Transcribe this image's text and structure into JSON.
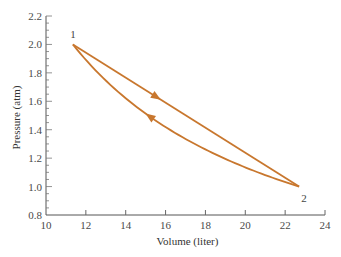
{
  "chart_data": {
    "type": "line",
    "title": "",
    "xlabel": "Volume (liter)",
    "ylabel": "Pressure (atm)",
    "xlim": [
      10,
      24
    ],
    "ylim": [
      0.8,
      2.2
    ],
    "x_ticks": [
      10,
      12,
      14,
      16,
      18,
      20,
      22,
      24
    ],
    "x_tick_labels": [
      "10",
      "12",
      "14",
      "16",
      "18",
      "20",
      "22",
      "24"
    ],
    "y_ticks": [
      0.8,
      1.0,
      1.2,
      1.4,
      1.6,
      1.8,
      2.0,
      2.2
    ],
    "y_tick_labels": [
      "0.8",
      "1.0",
      "1.2",
      "1.4",
      "1.6",
      "1.8",
      "2.0",
      "2.2"
    ],
    "y_minor_step": 0.05,
    "grid": false,
    "legend": null,
    "color": "#c8772e",
    "points": [
      {
        "label": "1",
        "x": 11.35,
        "y": 2.0
      },
      {
        "label": "2",
        "x": 22.7,
        "y": 1.0
      }
    ],
    "series": [
      {
        "name": "Path 1 to 2 (straight line)",
        "direction": "1 -> 2",
        "shape": "linear",
        "x": [
          11.35,
          22.7
        ],
        "y": [
          2.0,
          1.0
        ]
      },
      {
        "name": "Path 2 to 1 (isotherm, PV = const)",
        "direction": "2 -> 1",
        "shape": "curve",
        "x": [
          22.7,
          20.0,
          18.0,
          16.0,
          14.0,
          12.0,
          11.35
        ],
        "y": [
          1.0,
          1.135,
          1.261,
          1.419,
          1.621,
          1.892,
          2.0
        ]
      }
    ],
    "annotations": [
      {
        "text": "1",
        "x": 11.35,
        "y": 2.0,
        "position": "above"
      },
      {
        "text": "2",
        "x": 22.7,
        "y": 1.0,
        "position": "below-right"
      }
    ]
  }
}
